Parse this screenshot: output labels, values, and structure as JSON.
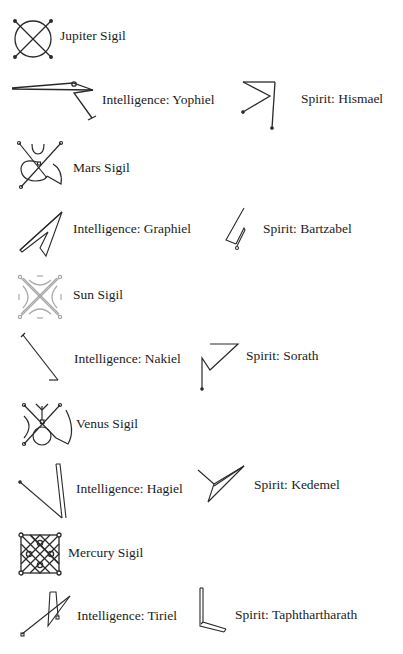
{
  "sigils": [
    {
      "id": "jupiter",
      "label": "Jupiter Sigil",
      "type": "planet"
    },
    {
      "id": "yophiel",
      "label": "Intelligence: Yophiel",
      "type": "intelligence"
    },
    {
      "id": "hismael",
      "label": "Spirit: Hismael",
      "type": "spirit"
    },
    {
      "id": "mars",
      "label": "Mars Sigil",
      "type": "planet"
    },
    {
      "id": "graphiel",
      "label": "Intelligence: Graphiel",
      "type": "intelligence"
    },
    {
      "id": "bartzabel",
      "label": "Spirit: Bartzabel",
      "type": "spirit"
    },
    {
      "id": "sun",
      "label": "Sun Sigil",
      "type": "planet"
    },
    {
      "id": "nakiel",
      "label": "Intelligence: Nakiel",
      "type": "intelligence"
    },
    {
      "id": "sorath",
      "label": "Spirit: Sorath",
      "type": "spirit"
    },
    {
      "id": "venus",
      "label": "Venus Sigil",
      "type": "planet"
    },
    {
      "id": "hagiel",
      "label": "Intelligence: Hagiel",
      "type": "intelligence"
    },
    {
      "id": "kedemel",
      "label": "Spirit: Kedemel",
      "type": "spirit"
    },
    {
      "id": "mercury",
      "label": "Mercury Sigil",
      "type": "planet"
    },
    {
      "id": "tiriel",
      "label": "Intelligence: Tiriel",
      "type": "intelligence"
    },
    {
      "id": "taphthartharath",
      "label": "Spirit: Taphthartharath",
      "type": "spirit"
    }
  ],
  "colors": {
    "ink": "#2a2a2a",
    "sun_ink": "#a8a8a8",
    "background": "#ffffff"
  }
}
